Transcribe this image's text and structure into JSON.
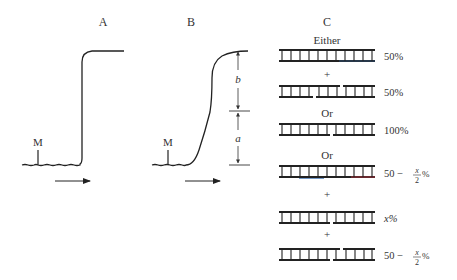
{
  "panels": {
    "A": {
      "label": "A",
      "marker_label": "M",
      "description": "sharp single-step boundary trace"
    },
    "B": {
      "label": "B",
      "marker_label": "M",
      "dim_upper_label": "b",
      "dim_lower_label": "a",
      "description": "two-component boundary trace with steps a and b"
    },
    "C": {
      "label": "C",
      "either_label": "Either",
      "or_label_1": "Or",
      "or_label_2": "Or",
      "plus": "+",
      "rows": [
        {
          "id": "either-intact",
          "percent": "50%"
        },
        {
          "id": "either-two-nicks",
          "percent": "50%"
        },
        {
          "id": "or1-one-nick",
          "percent": "100%"
        },
        {
          "id": "or2-intact",
          "percent_prefix": "50 − ",
          "frac_num": "x",
          "frac_den": "2",
          "percent_suffix": "%"
        },
        {
          "id": "or2-one-nick",
          "percent": "x%"
        },
        {
          "id": "or2-two-nicks",
          "percent_prefix": "50 − ",
          "frac_num": "x",
          "frac_den": "2",
          "percent_suffix": "%"
        }
      ]
    }
  },
  "colors": {
    "ink": "#222222",
    "label": "#333333",
    "accent_red": "#b0303a",
    "accent_blue": "#3a6fb0"
  }
}
